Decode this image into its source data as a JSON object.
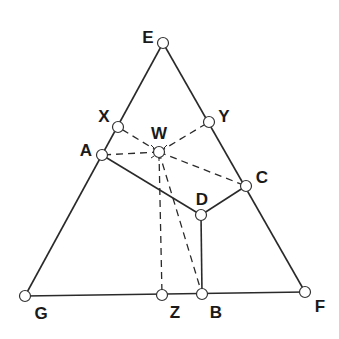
{
  "diagram": {
    "type": "geometric-construction",
    "points": {
      "E": {
        "label": "E",
        "x": 163,
        "y": 43
      },
      "X": {
        "label": "X",
        "x": 118,
        "y": 127
      },
      "Y": {
        "label": "Y",
        "x": 209,
        "y": 122
      },
      "W": {
        "label": "W",
        "x": 159,
        "y": 152
      },
      "A": {
        "label": "A",
        "x": 102,
        "y": 155
      },
      "C": {
        "label": "C",
        "x": 246,
        "y": 186
      },
      "D": {
        "label": "D",
        "x": 201,
        "y": 215
      },
      "G": {
        "label": "G",
        "x": 25,
        "y": 296
      },
      "Z": {
        "label": "Z",
        "x": 162,
        "y": 295
      },
      "B": {
        "label": "B",
        "x": 202,
        "y": 294
      },
      "F": {
        "label": "F",
        "x": 305,
        "y": 292
      }
    },
    "solid_edges": [
      [
        "E",
        "G"
      ],
      [
        "E",
        "F"
      ],
      [
        "G",
        "F"
      ],
      [
        "A",
        "D"
      ],
      [
        "D",
        "C"
      ],
      [
        "D",
        "B"
      ]
    ],
    "dashed_edges": [
      [
        "W",
        "X"
      ],
      [
        "W",
        "Y"
      ],
      [
        "W",
        "A"
      ],
      [
        "W",
        "C"
      ],
      [
        "W",
        "Z"
      ],
      [
        "W",
        "B"
      ]
    ],
    "label_positions": {
      "E": {
        "x": 148,
        "y": 37
      },
      "X": {
        "x": 104,
        "y": 116
      },
      "Y": {
        "x": 224,
        "y": 116
      },
      "W": {
        "x": 159,
        "y": 133
      },
      "A": {
        "x": 86,
        "y": 150
      },
      "C": {
        "x": 262,
        "y": 177
      },
      "D": {
        "x": 202,
        "y": 199
      },
      "G": {
        "x": 41,
        "y": 313
      },
      "Z": {
        "x": 175,
        "y": 312
      },
      "B": {
        "x": 216,
        "y": 312
      },
      "F": {
        "x": 320,
        "y": 306
      }
    },
    "colors": {
      "line": "#2a2a2a",
      "point_fill": "#ffffff",
      "point_stroke": "#333333",
      "label": "#1a1a1a"
    }
  }
}
